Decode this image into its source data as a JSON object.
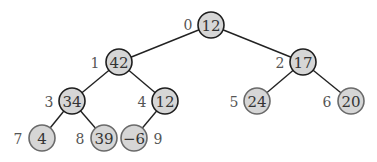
{
  "diagram": {
    "type": "binary-heap-tree",
    "nodes": [
      {
        "index": "0",
        "value": "12",
        "x": 211,
        "y": 25,
        "lx": 188,
        "ly": 24,
        "style": "dark"
      },
      {
        "index": "1",
        "value": "42",
        "x": 119,
        "y": 62,
        "lx": 95,
        "ly": 62,
        "style": "dark"
      },
      {
        "index": "2",
        "value": "17",
        "x": 303,
        "y": 62,
        "lx": 280,
        "ly": 62,
        "style": "dark"
      },
      {
        "index": "3",
        "value": "34",
        "x": 72,
        "y": 101,
        "lx": 49,
        "ly": 101,
        "style": "dark"
      },
      {
        "index": "4",
        "value": "12",
        "x": 165,
        "y": 101,
        "lx": 142,
        "ly": 101,
        "style": "dark"
      },
      {
        "index": "5",
        "value": "24",
        "x": 257,
        "y": 101,
        "lx": 234,
        "ly": 101,
        "style": "light"
      },
      {
        "index": "6",
        "value": "20",
        "x": 351,
        "y": 101,
        "lx": 327,
        "ly": 101,
        "style": "light"
      },
      {
        "index": "7",
        "value": "4",
        "x": 42,
        "y": 138,
        "lx": 18,
        "ly": 138,
        "style": "light"
      },
      {
        "index": "8",
        "value": "39",
        "x": 104,
        "y": 138,
        "lx": 80,
        "ly": 138,
        "style": "light"
      },
      {
        "index": "9",
        "value": "−6",
        "x": 134,
        "y": 138,
        "lx": 158,
        "ly": 138,
        "style": "light"
      }
    ],
    "edges": [
      [
        0,
        1
      ],
      [
        0,
        2
      ],
      [
        1,
        3
      ],
      [
        1,
        4
      ],
      [
        2,
        5
      ],
      [
        2,
        6
      ],
      [
        3,
        7
      ],
      [
        3,
        8
      ],
      [
        4,
        9
      ]
    ],
    "node_radius": 13,
    "colors": {
      "fill": "#d6d6d6",
      "dark_stroke": "#1e1e1e",
      "light_stroke": "#6a6a6a",
      "edge": "#222222"
    }
  }
}
